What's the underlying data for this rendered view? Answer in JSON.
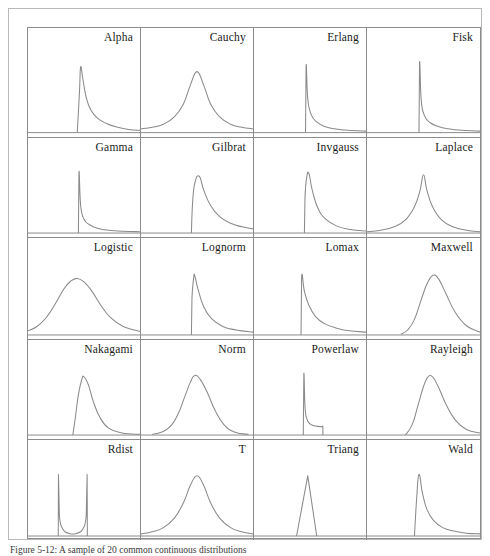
{
  "figure": {
    "caption": "Figure 5-12: A sample of 20 common continuous distributions",
    "border_color": "#8c8c8c",
    "curve_color": "#8a8a8a",
    "background": "#ffffff",
    "columns": 4,
    "rows": 5
  },
  "chart_data": {
    "type": "line",
    "title": "",
    "xlabel": "",
    "ylabel": "",
    "grid": false,
    "legend_position": "none",
    "layout": "4x5 small-multiples grid of probability density functions",
    "axis_note": "each panel shares a common x range 0..1 (normalized) and y range 0..1 (normalized density); only a baseline axis is drawn",
    "panels": [
      {
        "row": 1,
        "col": 1,
        "label": "Alpha",
        "shape": "sharp left spike with long right tail",
        "peak_x": 0.47,
        "peak_y": 0.86,
        "support": [
          0.44,
          1.0
        ],
        "x": [
          0.44,
          0.46,
          0.47,
          0.49,
          0.52,
          0.56,
          0.62,
          0.7,
          0.8,
          0.9,
          1.0
        ],
        "y": [
          0.0,
          0.55,
          0.86,
          0.7,
          0.46,
          0.3,
          0.19,
          0.12,
          0.07,
          0.04,
          0.03
        ]
      },
      {
        "row": 1,
        "col": 2,
        "label": "Cauchy",
        "shape": "symmetric heavy-tailed bell",
        "peak_x": 0.5,
        "peak_y": 0.8,
        "support": [
          0.0,
          1.0
        ],
        "x": [
          0.0,
          0.1,
          0.2,
          0.3,
          0.38,
          0.44,
          0.5,
          0.56,
          0.62,
          0.7,
          0.8,
          0.9,
          1.0
        ],
        "y": [
          0.05,
          0.07,
          0.11,
          0.21,
          0.38,
          0.62,
          0.8,
          0.62,
          0.38,
          0.21,
          0.11,
          0.07,
          0.05
        ]
      },
      {
        "row": 1,
        "col": 3,
        "label": "Erlang",
        "shape": "narrow vertical spike then rapid decay",
        "peak_x": 0.46,
        "peak_y": 0.88,
        "support": [
          0.46,
          1.0
        ],
        "x": [
          0.46,
          0.465,
          0.48,
          0.51,
          0.56,
          0.63,
          0.72,
          0.84,
          1.0
        ],
        "y": [
          0.0,
          0.88,
          0.44,
          0.24,
          0.14,
          0.08,
          0.05,
          0.03,
          0.02
        ]
      },
      {
        "row": 1,
        "col": 4,
        "label": "Fisk",
        "shape": "narrow vertical spike then rapid decay",
        "peak_x": 0.46,
        "peak_y": 0.92,
        "support": [
          0.46,
          1.0
        ],
        "x": [
          0.46,
          0.465,
          0.48,
          0.51,
          0.56,
          0.63,
          0.72,
          0.84,
          1.0
        ],
        "y": [
          0.0,
          0.92,
          0.42,
          0.22,
          0.13,
          0.08,
          0.05,
          0.03,
          0.02
        ]
      },
      {
        "row": 2,
        "col": 1,
        "label": "Gamma",
        "shape": "narrow vertical spike then rapid decay",
        "peak_x": 0.45,
        "peak_y": 0.88,
        "support": [
          0.45,
          1.0
        ],
        "x": [
          0.45,
          0.455,
          0.47,
          0.5,
          0.55,
          0.62,
          0.72,
          0.85,
          1.0
        ],
        "y": [
          0.0,
          0.88,
          0.4,
          0.2,
          0.12,
          0.07,
          0.04,
          0.025,
          0.02
        ]
      },
      {
        "row": 2,
        "col": 2,
        "label": "Gilbrat",
        "shape": "steep rise, skewed peak, long right tail",
        "peak_x": 0.52,
        "peak_y": 0.82,
        "support": [
          0.45,
          1.0
        ],
        "x": [
          0.45,
          0.46,
          0.48,
          0.52,
          0.56,
          0.62,
          0.7,
          0.8,
          0.9,
          1.0
        ],
        "y": [
          0.0,
          0.42,
          0.72,
          0.82,
          0.62,
          0.4,
          0.24,
          0.14,
          0.09,
          0.06
        ]
      },
      {
        "row": 2,
        "col": 3,
        "label": "Invgauss",
        "shape": "steep rise, narrow skewed peak, right tail",
        "peak_x": 0.49,
        "peak_y": 0.86,
        "support": [
          0.45,
          1.0
        ],
        "x": [
          0.45,
          0.455,
          0.47,
          0.49,
          0.52,
          0.57,
          0.64,
          0.74,
          0.86,
          1.0
        ],
        "y": [
          0.0,
          0.5,
          0.8,
          0.86,
          0.62,
          0.36,
          0.2,
          0.1,
          0.05,
          0.03
        ]
      },
      {
        "row": 2,
        "col": 4,
        "label": "Laplace",
        "shape": "symmetric cusp peak with exponential tails",
        "peak_x": 0.5,
        "peak_y": 0.84,
        "support": [
          0.0,
          1.0
        ],
        "x": [
          0.0,
          0.12,
          0.24,
          0.34,
          0.42,
          0.47,
          0.5,
          0.53,
          0.58,
          0.66,
          0.76,
          0.88,
          1.0
        ],
        "y": [
          0.02,
          0.04,
          0.09,
          0.19,
          0.38,
          0.62,
          0.84,
          0.62,
          0.38,
          0.19,
          0.09,
          0.04,
          0.02
        ]
      },
      {
        "row": 3,
        "col": 1,
        "label": "Logistic",
        "shape": "broad symmetric bell",
        "peak_x": 0.44,
        "peak_y": 0.8,
        "support": [
          0.0,
          1.0
        ],
        "x": [
          0.0,
          0.08,
          0.16,
          0.24,
          0.32,
          0.38,
          0.44,
          0.5,
          0.57,
          0.65,
          0.74,
          0.85,
          1.0
        ],
        "y": [
          0.06,
          0.12,
          0.24,
          0.43,
          0.65,
          0.76,
          0.8,
          0.75,
          0.62,
          0.42,
          0.24,
          0.12,
          0.05
        ]
      },
      {
        "row": 3,
        "col": 2,
        "label": "Lognorm",
        "shape": "steep rise, narrow skewed peak, long right tail",
        "peak_x": 0.48,
        "peak_y": 0.84,
        "support": [
          0.45,
          1.0
        ],
        "x": [
          0.45,
          0.455,
          0.47,
          0.48,
          0.51,
          0.56,
          0.63,
          0.73,
          0.85,
          1.0
        ],
        "y": [
          0.0,
          0.52,
          0.8,
          0.84,
          0.64,
          0.4,
          0.23,
          0.12,
          0.07,
          0.04
        ]
      },
      {
        "row": 3,
        "col": 3,
        "label": "Lomax",
        "shape": "vertical jump at left then monotone decay",
        "peak_x": 0.42,
        "peak_y": 0.82,
        "support": [
          0.42,
          1.0
        ],
        "x": [
          0.42,
          0.425,
          0.45,
          0.49,
          0.55,
          0.63,
          0.73,
          0.85,
          1.0
        ],
        "y": [
          0.0,
          0.82,
          0.62,
          0.42,
          0.26,
          0.16,
          0.1,
          0.06,
          0.04
        ]
      },
      {
        "row": 3,
        "col": 4,
        "label": "Maxwell",
        "shape": "right-skewed bell starting from zero",
        "peak_x": 0.58,
        "peak_y": 0.84,
        "support": [
          0.3,
          1.0
        ],
        "x": [
          0.3,
          0.36,
          0.42,
          0.48,
          0.53,
          0.58,
          0.63,
          0.7,
          0.78,
          0.88,
          1.0
        ],
        "y": [
          0.01,
          0.07,
          0.22,
          0.5,
          0.72,
          0.84,
          0.8,
          0.58,
          0.32,
          0.13,
          0.04
        ]
      },
      {
        "row": 4,
        "col": 1,
        "label": "Nakagami",
        "shape": "steep rise, narrow right-skewed bell",
        "peak_x": 0.5,
        "peak_y": 0.84,
        "support": [
          0.4,
          1.0
        ],
        "x": [
          0.4,
          0.42,
          0.45,
          0.48,
          0.5,
          0.54,
          0.58,
          0.64,
          0.72,
          0.84,
          1.0
        ],
        "y": [
          0.0,
          0.22,
          0.58,
          0.8,
          0.84,
          0.72,
          0.5,
          0.26,
          0.1,
          0.03,
          0.01
        ]
      },
      {
        "row": 4,
        "col": 2,
        "label": "Norm",
        "shape": "symmetric gaussian bell",
        "peak_x": 0.48,
        "peak_y": 0.86,
        "support": [
          0.1,
          1.0
        ],
        "x": [
          0.1,
          0.18,
          0.26,
          0.33,
          0.39,
          0.44,
          0.48,
          0.53,
          0.59,
          0.66,
          0.74,
          0.84,
          0.96
        ],
        "y": [
          0.01,
          0.04,
          0.12,
          0.3,
          0.55,
          0.76,
          0.86,
          0.8,
          0.62,
          0.36,
          0.15,
          0.04,
          0.01
        ]
      },
      {
        "row": 4,
        "col": 3,
        "label": "Powerlaw",
        "shape": "vertical spike dropping to a low plateau with abrupt cutoff",
        "peak_x": 0.44,
        "peak_y": 0.88,
        "support": [
          0.44,
          0.62
        ],
        "x": [
          0.44,
          0.445,
          0.455,
          0.47,
          0.5,
          0.55,
          0.6,
          0.615,
          0.615
        ],
        "y": [
          0.0,
          0.88,
          0.42,
          0.24,
          0.16,
          0.13,
          0.12,
          0.12,
          0.0
        ]
      },
      {
        "row": 4,
        "col": 4,
        "label": "Rayleigh",
        "shape": "right-skewed bell starting from zero",
        "peak_x": 0.56,
        "peak_y": 0.86,
        "support": [
          0.34,
          1.0
        ],
        "x": [
          0.34,
          0.4,
          0.45,
          0.5,
          0.54,
          0.58,
          0.63,
          0.7,
          0.78,
          0.88,
          1.0
        ],
        "y": [
          0.0,
          0.15,
          0.42,
          0.7,
          0.84,
          0.84,
          0.7,
          0.44,
          0.22,
          0.08,
          0.03
        ]
      },
      {
        "row": 5,
        "col": 1,
        "label": "Rdist",
        "shape": "U-shaped bathtub with steep walls at both edges",
        "peak_x": 0.0,
        "peak_y": 0.88,
        "support": [
          0.27,
          0.53
        ],
        "x": [
          0.27,
          0.272,
          0.28,
          0.31,
          0.36,
          0.4,
          0.44,
          0.49,
          0.52,
          0.528,
          0.53
        ],
        "y": [
          0.0,
          0.88,
          0.3,
          0.1,
          0.04,
          0.03,
          0.04,
          0.1,
          0.3,
          0.88,
          0.0
        ]
      },
      {
        "row": 5,
        "col": 2,
        "label": "T",
        "shape": "symmetric peaked bell with heavy tails",
        "peak_x": 0.5,
        "peak_y": 0.86,
        "support": [
          0.0,
          1.0
        ],
        "x": [
          0.0,
          0.1,
          0.2,
          0.3,
          0.38,
          0.44,
          0.5,
          0.56,
          0.62,
          0.7,
          0.8,
          0.9,
          1.0
        ],
        "y": [
          0.03,
          0.06,
          0.12,
          0.26,
          0.48,
          0.72,
          0.86,
          0.72,
          0.48,
          0.26,
          0.12,
          0.06,
          0.03
        ]
      },
      {
        "row": 5,
        "col": 3,
        "label": "Triang",
        "shape": "triangle with straight sides and sharp apex",
        "peak_x": 0.48,
        "peak_y": 0.86,
        "support": [
          0.38,
          0.56
        ],
        "x": [
          0.38,
          0.48,
          0.56
        ],
        "y": [
          0.0,
          0.86,
          0.0
        ]
      },
      {
        "row": 5,
        "col": 4,
        "label": "Wald",
        "shape": "steep spike then long right tail",
        "peak_x": 0.46,
        "peak_y": 0.88,
        "support": [
          0.42,
          1.0
        ],
        "x": [
          0.42,
          0.44,
          0.46,
          0.49,
          0.53,
          0.59,
          0.67,
          0.77,
          0.88,
          1.0
        ],
        "y": [
          0.0,
          0.55,
          0.88,
          0.62,
          0.38,
          0.22,
          0.12,
          0.07,
          0.04,
          0.03
        ]
      }
    ]
  }
}
